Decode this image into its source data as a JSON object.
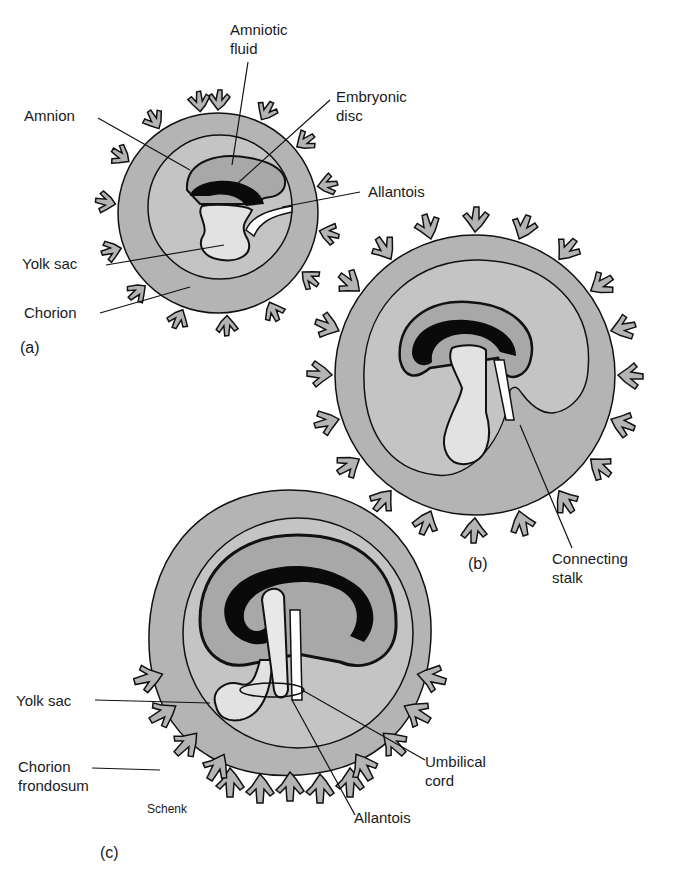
{
  "colors": {
    "chorion_fill": "#b4b4b4",
    "cavity_fill": "#c4c4c4",
    "amnion_cavity": "#a8a8a8",
    "yolk_fill": "#e2e2e2",
    "embryo": "#0a0a0a",
    "outline": "#111111",
    "background": "#ffffff"
  },
  "panels": {
    "a": {
      "label": "(a)",
      "annotations": {
        "amniotic_fluid": "Amniotic\nfluid",
        "amniotic_fluid_l1": "Amniotic",
        "amniotic_fluid_l2": "fluid",
        "embryonic_disc_l1": "Embryonic",
        "embryonic_disc_l2": "disc",
        "amnion": "Amnion",
        "allantois": "Allantois",
        "yolk_sac": "Yolk sac",
        "chorion": "Chorion"
      }
    },
    "b": {
      "label": "(b)",
      "annotations": {
        "connecting_stalk_l1": "Connecting",
        "connecting_stalk_l2": "stalk"
      }
    },
    "c": {
      "label": "(c)",
      "annotations": {
        "yolk_sac": "Yolk sac",
        "chorion_frondosum_l1": "Chorion",
        "chorion_frondosum_l2": "frondosum",
        "umbilical_cord_l1": "Umbilical",
        "umbilical_cord_l2": "cord",
        "allantois": "Allantois",
        "signature": "Schenk"
      }
    }
  }
}
